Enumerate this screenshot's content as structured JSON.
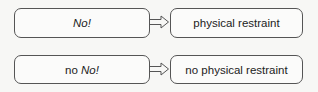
{
  "diagram": {
    "rows": [
      {
        "left": {
          "prefix": "",
          "italic": "No!"
        },
        "right": {
          "label": "physical restraint"
        }
      },
      {
        "left": {
          "prefix": "no ",
          "italic": "No!"
        },
        "right": {
          "label": "no physical restraint"
        }
      }
    ],
    "arrow_style": "hollow-right-arrow",
    "colors": {
      "stroke": "#555555",
      "background": "#f7f7f5"
    }
  }
}
